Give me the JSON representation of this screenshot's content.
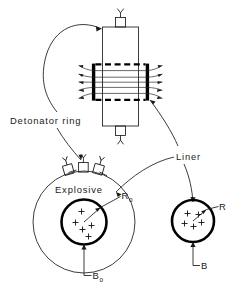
{
  "figure": {
    "labels": {
      "detonator_ring": "Detonator ring",
      "liner": "Liner",
      "explosive": "Explosive",
      "radius_initial": "R",
      "radius_initial_sub": "o",
      "radius_final": "R",
      "field_initial": "B",
      "field_initial_sub": "o",
      "field_final": "B"
    },
    "colors": {
      "ink": "#1a1a1a",
      "bold_ink": "#000000",
      "background": "#ffffff"
    },
    "counts": {
      "detonators_on_ring": 3,
      "lead_wires_left": 5,
      "lead_wires_right": 5,
      "plus_marks_left_circle": 5,
      "plus_marks_right_circle": 5
    }
  }
}
